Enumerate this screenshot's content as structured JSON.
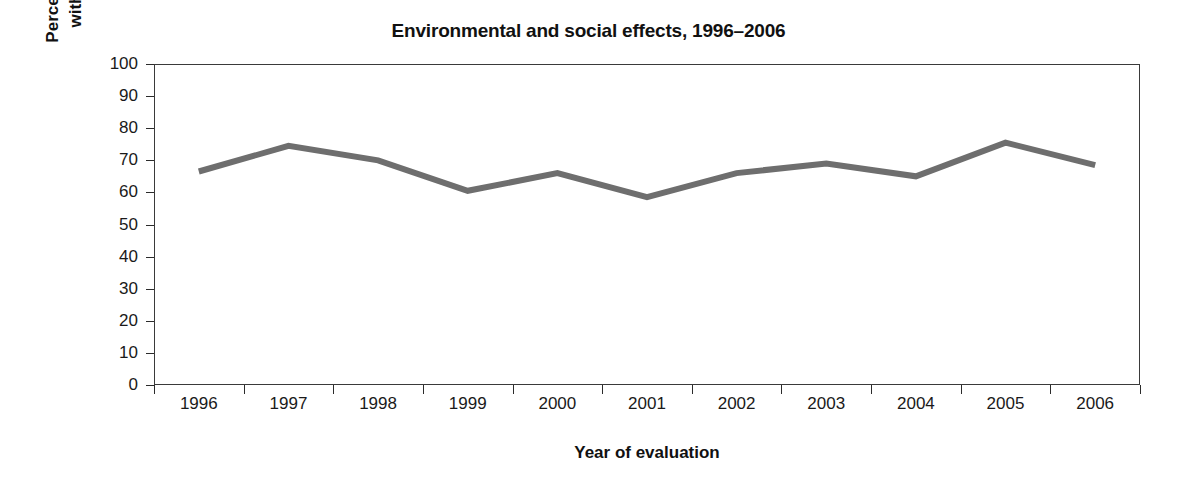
{
  "chart_data": {
    "type": "line",
    "title": "Environmental and social effects, 1996–2006",
    "xlabel": "Year of evaluation",
    "ylabel": "Percentage of projects with “high” ratings",
    "ylabel_lines": [
      "Percentage of projects",
      "with “high” ratings"
    ],
    "categories": [
      "1996",
      "1997",
      "1998",
      "1999",
      "2000",
      "2001",
      "2002",
      "2003",
      "2004",
      "2005",
      "2006"
    ],
    "values": [
      66.5,
      74.5,
      70,
      60.5,
      66,
      58.5,
      66,
      69,
      65,
      75.5,
      68.5
    ],
    "series": [
      {
        "name": "Percentage of projects with “high” ratings",
        "values": [
          66.5,
          74.5,
          70,
          60.5,
          66,
          58.5,
          66,
          69,
          65,
          75.5,
          68.5
        ]
      }
    ],
    "ylim": [
      0,
      100
    ],
    "y_ticks": [
      0,
      10,
      20,
      30,
      40,
      50,
      60,
      70,
      80,
      90,
      100
    ],
    "y_tick_labels": [
      "0",
      "10",
      "20",
      "30",
      "40",
      "50",
      "60",
      "70",
      "80",
      "90",
      "100"
    ],
    "grid": false,
    "legend": false,
    "legend_position": "none",
    "line_color": "#6e6e6e",
    "line_width": 6,
    "axis_color": "#3a3a3a",
    "text_color": "#111111",
    "background_color": "#ffffff"
  }
}
